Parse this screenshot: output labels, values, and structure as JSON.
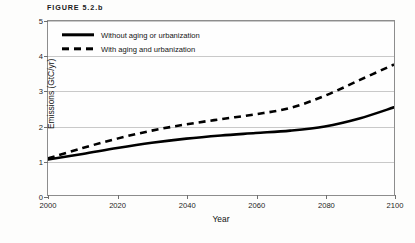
{
  "figure": {
    "title": "FIGURE 5.2.b"
  },
  "legend": {
    "position": "top-left-inside",
    "items": [
      {
        "label": "Without aging or urbanization",
        "style": "solid",
        "swatch": "solid-line-swatch"
      },
      {
        "label": "With aging and urbanization",
        "style": "dashed",
        "swatch": "dashed-line-swatch"
      }
    ]
  },
  "axes": {
    "x": {
      "label": "Year",
      "ticks": [
        "2000",
        "2020",
        "2040",
        "2060",
        "2080",
        "2100"
      ],
      "min": 2000,
      "max": 2100
    },
    "y": {
      "label": "Emissions (GtC/yr)",
      "ticks": [
        "0",
        "1",
        "2",
        "3",
        "4",
        "5"
      ],
      "min": 0,
      "max": 5
    }
  },
  "chart_data": {
    "type": "line",
    "title": "FIGURE 5.2.b",
    "xlabel": "Year",
    "ylabel": "Emissions (GtC/yr)",
    "xlim": [
      2000,
      2100
    ],
    "ylim": [
      0,
      5
    ],
    "grid": true,
    "legend_position": "upper left",
    "x": [
      2000,
      2010,
      2020,
      2030,
      2040,
      2050,
      2060,
      2070,
      2080,
      2090,
      2100
    ],
    "series": [
      {
        "name": "Without aging or urbanization",
        "style": "solid",
        "color": "#000000",
        "values": [
          1.02,
          1.18,
          1.35,
          1.5,
          1.62,
          1.71,
          1.78,
          1.85,
          1.97,
          2.2,
          2.52
        ]
      },
      {
        "name": "With aging and urbanization",
        "style": "dashed",
        "color": "#000000",
        "values": [
          1.05,
          1.35,
          1.62,
          1.85,
          2.03,
          2.18,
          2.32,
          2.5,
          2.85,
          3.3,
          3.75
        ]
      }
    ]
  },
  "colors": {
    "line": "#000000",
    "grid": "#c9c9c9",
    "frame": "#8d8d8d",
    "background": "#fdfdfc",
    "text": "#1b1b1b"
  }
}
